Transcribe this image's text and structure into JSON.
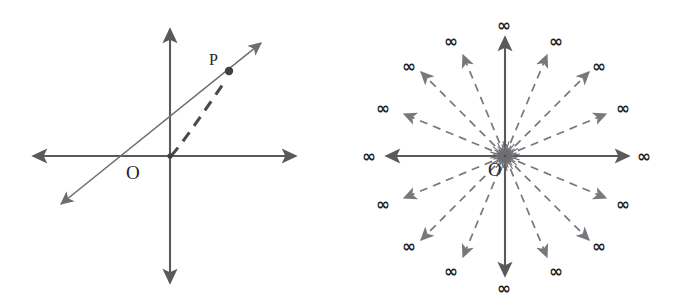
{
  "figure": {
    "background_color": "#ffffff",
    "width": 681,
    "height": 308,
    "axis_color": "#5a5a5e",
    "ray_color": "#77777d",
    "label_color": "#242428"
  },
  "left_panel": {
    "name": "affine-line-with-point",
    "origin_label": "O",
    "point_label": "P",
    "axes": [
      {
        "name": "x-axis",
        "style": "solid",
        "arrows": "both"
      },
      {
        "name": "y-axis",
        "style": "solid",
        "arrows": "both"
      }
    ],
    "diagonal": {
      "name": "diagonal-line",
      "style": "solid",
      "arrows": "both"
    },
    "chord": {
      "name": "dashed-chord-origin-to-p",
      "style": "dashed",
      "arrows": "none"
    }
  },
  "right_panel": {
    "name": "pencil-of-lines-at-infinity",
    "origin_label": "O",
    "infinity_symbol": "∞",
    "solid_ray_count": 4,
    "dashed_ray_count": 12,
    "total_ray_count": 16,
    "infinity_labels": [
      {
        "id": "inf-e",
        "angle_deg": 0,
        "text": "∞"
      },
      {
        "id": "inf-ene",
        "angle_deg": 22.5,
        "text": "∞"
      },
      {
        "id": "inf-ne",
        "angle_deg": 45,
        "text": "∞"
      },
      {
        "id": "inf-nne",
        "angle_deg": 67.5,
        "text": "∞"
      },
      {
        "id": "inf-n",
        "angle_deg": 90,
        "text": "∞"
      },
      {
        "id": "inf-nnw",
        "angle_deg": 112.5,
        "text": "∞"
      },
      {
        "id": "inf-nw",
        "angle_deg": 135,
        "text": "∞"
      },
      {
        "id": "inf-wnw",
        "angle_deg": 157.5,
        "text": "∞"
      },
      {
        "id": "inf-w",
        "angle_deg": 180,
        "text": "∞"
      },
      {
        "id": "inf-wsw",
        "angle_deg": 202.5,
        "text": "∞"
      },
      {
        "id": "inf-sw",
        "angle_deg": 225,
        "text": "∞"
      },
      {
        "id": "inf-ssw",
        "angle_deg": 247.5,
        "text": "∞"
      },
      {
        "id": "inf-s",
        "angle_deg": 270,
        "text": "∞"
      },
      {
        "id": "inf-sse",
        "angle_deg": 292.5,
        "text": "∞"
      },
      {
        "id": "inf-se",
        "angle_deg": 315,
        "text": "∞"
      },
      {
        "id": "inf-ese",
        "angle_deg": 337.5,
        "text": "∞"
      }
    ]
  }
}
